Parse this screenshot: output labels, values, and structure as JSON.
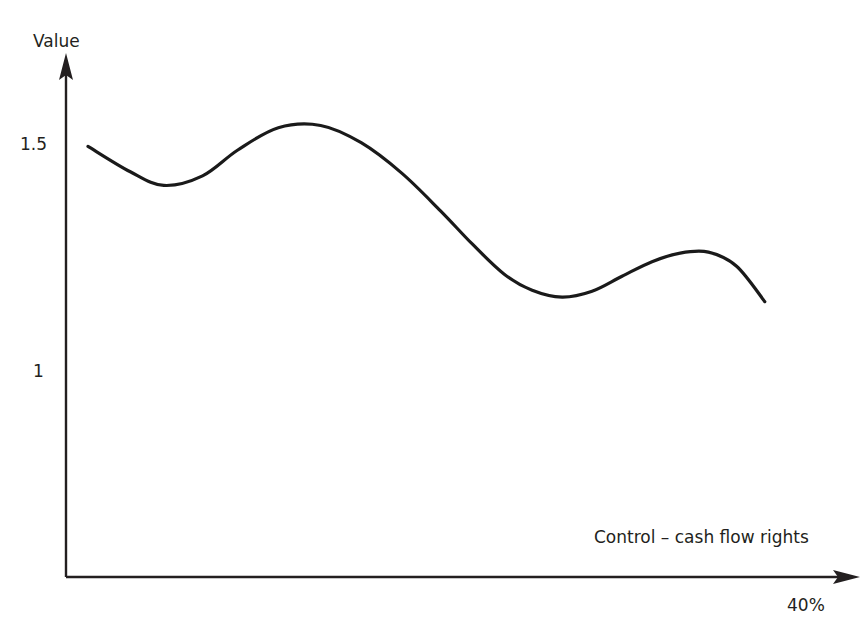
{
  "chart_data": {
    "type": "line",
    "title": "",
    "subtitle": "",
    "xlabel": "Control – cash flow rights",
    "ylabel": "Value",
    "grid": false,
    "legend": false,
    "legend_position": "none",
    "axis_style": "arrow-axes",
    "line_color": "#1a1a1a",
    "line_width": 3,
    "background_color": "#ffffff",
    "text_color": "#231f20",
    "x_tick_labels": [
      "40%"
    ],
    "y_tick_labels": [
      "1.5",
      "1"
    ],
    "xlim": [
      0,
      40
    ],
    "ylim": [
      0.85,
      1.65
    ],
    "x_unit": "%",
    "x": [
      0.0,
      2.4,
      4.3,
      6.5,
      8.5,
      10.8,
      13.2,
      15.5,
      17.8,
      20.0,
      21.8,
      23.6,
      25.2,
      26.9,
      28.6,
      30.3,
      32.0,
      33.6,
      35.2,
      36.8,
      38.4
    ],
    "y": [
      1.497,
      1.441,
      1.411,
      1.432,
      1.489,
      1.538,
      1.543,
      1.505,
      1.438,
      1.355,
      1.282,
      1.216,
      1.18,
      1.165,
      1.178,
      1.211,
      1.243,
      1.262,
      1.264,
      1.233,
      1.155
    ],
    "series": [
      {
        "name": "Value",
        "color": "#1a1a1a",
        "values": [
          1.497,
          1.441,
          1.411,
          1.432,
          1.489,
          1.538,
          1.543,
          1.505,
          1.438,
          1.355,
          1.282,
          1.216,
          1.18,
          1.165,
          1.178,
          1.211,
          1.243,
          1.262,
          1.264,
          1.233,
          1.155
        ]
      }
    ],
    "annotations": [],
    "notable_points": [
      {
        "label": "start",
        "x": 0.0,
        "y": 1.497
      },
      {
        "label": "local-minimum-1",
        "x": 4.3,
        "y": 1.411
      },
      {
        "label": "local-maximum-1",
        "x": 13.2,
        "y": 1.543
      },
      {
        "label": "local-minimum-2",
        "x": 26.9,
        "y": 1.165
      },
      {
        "label": "local-maximum-2",
        "x": 35.2,
        "y": 1.264
      },
      {
        "label": "end",
        "x": 39.8,
        "y": 0.978
      }
    ]
  },
  "axes": {
    "y_axis_label": "Value",
    "x_axis_label": "Control – cash flow rights",
    "y_ticks": [
      {
        "label": "1.5",
        "value": 1.5
      },
      {
        "label": "1",
        "value": 1.0
      }
    ],
    "x_ticks": [
      {
        "label": "40%",
        "value": 40
      }
    ]
  },
  "artifacts": {
    "top_edge_cropped_text": "· · ·"
  }
}
